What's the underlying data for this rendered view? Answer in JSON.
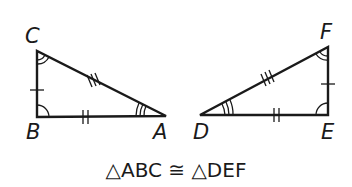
{
  "diagram": {
    "triangle_left": {
      "name": "ABC",
      "vertices": {
        "A": {
          "label": "A",
          "x": 166,
          "y": 116
        },
        "B": {
          "label": "B",
          "x": 37,
          "y": 117
        },
        "C": {
          "label": "C",
          "x": 37,
          "y": 51
        }
      },
      "side_marks": {
        "BC": 1,
        "AB": 2,
        "AC": 3
      },
      "angle_marks": {
        "B": 1,
        "C": 2,
        "A": 3
      }
    },
    "triangle_right": {
      "name": "DEF",
      "vertices": {
        "D": {
          "label": "D",
          "x": 200,
          "y": 115
        },
        "E": {
          "label": "E",
          "x": 328,
          "y": 115
        },
        "F": {
          "label": "F",
          "x": 328,
          "y": 47
        }
      },
      "side_marks": {
        "EF": 1,
        "DE": 2,
        "DF": 3
      },
      "angle_marks": {
        "E": 1,
        "F": 2,
        "D": 3
      }
    },
    "caption": "△ABC ≅ △DEF"
  }
}
